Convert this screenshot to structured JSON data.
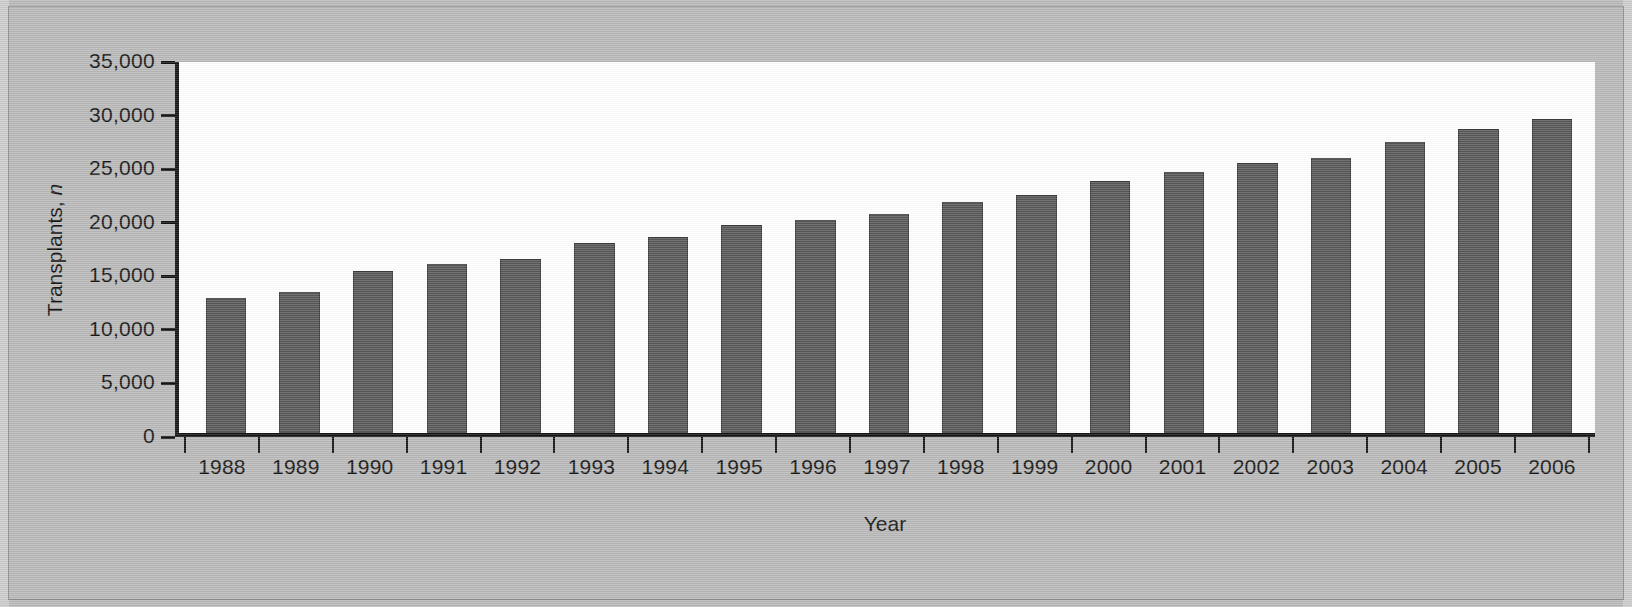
{
  "chart_data": {
    "type": "bar",
    "title": "",
    "xlabel": "Year",
    "ylabel": "Transplants, n",
    "ylabel_plain": "Transplants,",
    "ylabel_italic": "n",
    "categories": [
      "1988",
      "1989",
      "1990",
      "1991",
      "1992",
      "1993",
      "1994",
      "1995",
      "1996",
      "1997",
      "1998",
      "1999",
      "2000",
      "2001",
      "2002",
      "2003",
      "2004",
      "2005",
      "2006"
    ],
    "values": [
      12600,
      13200,
      15100,
      15800,
      16200,
      17700,
      18300,
      19400,
      19900,
      20400,
      21600,
      22200,
      23500,
      24400,
      25200,
      25700,
      27200,
      28400,
      29300
    ],
    "ylim": [
      0,
      35000
    ],
    "ytick_values": [
      0,
      5000,
      10000,
      15000,
      20000,
      25000,
      30000,
      35000
    ],
    "ytick_labels": [
      "0",
      "5,000",
      "10,000",
      "15,000",
      "20,000",
      "25,000",
      "30,000",
      "35,000"
    ],
    "grid": false,
    "legend": null,
    "bar_color": "#585858",
    "axis_color": "#141414",
    "plot_background": "#ffffff",
    "page_background": "#b9b9b9"
  }
}
